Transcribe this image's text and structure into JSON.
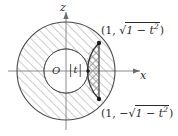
{
  "figure": {
    "type": "math-diagram",
    "axes": {
      "vertical_label": "z",
      "horizontal_label": "x",
      "origin_label": "O"
    },
    "labels": {
      "inner_radius": {
        "open_bar": "|",
        "variable": "t",
        "close_bar": "|"
      },
      "point_top": {
        "open_paren": "(",
        "x_value": "1",
        "comma": ", ",
        "sign": "",
        "radical": "√",
        "radicand_base": "1 − t",
        "radicand_exponent": "2",
        "close_paren": ")",
        "plain_text": "(1, √(1 − t²))"
      },
      "point_bottom": {
        "open_paren": "(",
        "x_value": "1",
        "comma": ", ",
        "sign": "−",
        "radical": "√",
        "radicand_base": "1 − t",
        "radicand_exponent": "2",
        "close_paren": ")",
        "plain_text": "(1, −√(1 − t²))"
      }
    },
    "colors": {
      "stroke": "#3a3a3a",
      "hatch": "#9a9a9a",
      "axis": "#8a8a8a",
      "point_fill": "#1a1a1a",
      "background": "#ffffff",
      "text": "#2a2a2a"
    },
    "geometry": {
      "center_x": 66,
      "center_y": 71,
      "outer_radius": 49,
      "inner_radius": 22,
      "chord_x": 99,
      "vertex_top_y": 43,
      "vertex_bottom_y": 99
    }
  }
}
